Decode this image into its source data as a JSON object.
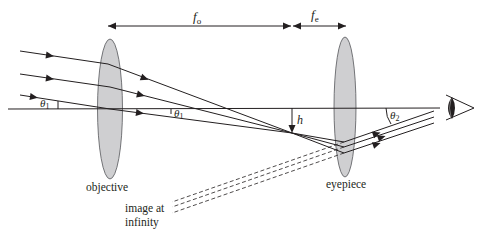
{
  "diagram": {
    "labels": {
      "focal_objective_symbol": "f",
      "focal_objective_sub": "o",
      "focal_eyepiece_symbol": "f",
      "focal_eyepiece_sub": "e",
      "theta1_symbol": "θ",
      "theta1_sub": "1",
      "theta1_inner_symbol": "θ",
      "theta1_inner_sub": "1",
      "theta2_symbol": "θ",
      "theta2_sub": "2",
      "height": "h",
      "objective": "objective",
      "eyepiece": "eyepiece",
      "image_line1": "image at",
      "image_line2": "infinity"
    },
    "colors": {
      "line": "#231f20",
      "lens_fill": "#cfcfd1",
      "lens_stroke": "#55575a",
      "background": "#ffffff"
    },
    "elements": [
      {
        "name": "objective-lens",
        "type": "converging lens",
        "center_x": 110
      },
      {
        "name": "eyepiece-lens",
        "type": "converging lens",
        "center_x": 345
      },
      {
        "name": "optical-axis",
        "y": 108
      },
      {
        "name": "focal-point",
        "x": 292,
        "y": 133
      },
      {
        "name": "eye",
        "x": 455,
        "y": 108
      }
    ]
  }
}
